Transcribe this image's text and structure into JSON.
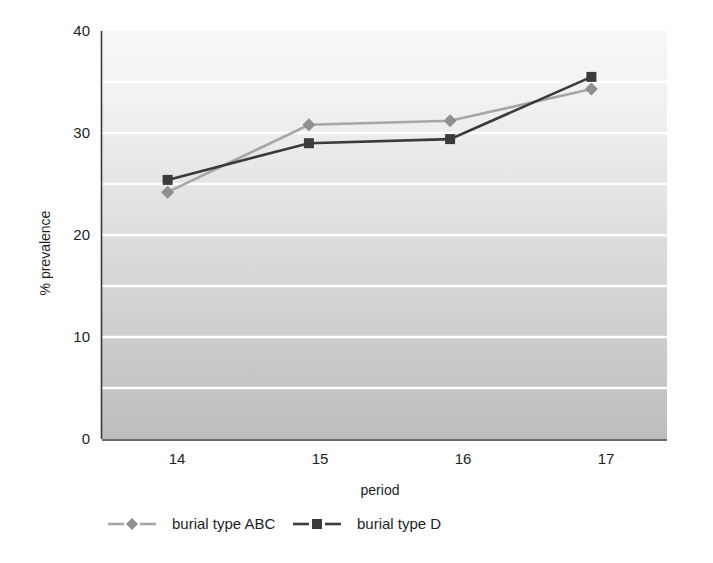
{
  "chart_data": {
    "type": "line",
    "title": "",
    "subtitle": "",
    "xlabel": "period",
    "ylabel": "% prevalence",
    "x": [
      14,
      15,
      16,
      17
    ],
    "categories": [
      "14",
      "15",
      "16",
      "17"
    ],
    "xtick_labels": [
      "14",
      "15",
      "16",
      "17"
    ],
    "ytick_labels": [
      "0",
      "10",
      "20",
      "30",
      "40"
    ],
    "ytick_values": [
      0,
      10,
      20,
      30,
      40
    ],
    "ylim": [
      0,
      40
    ],
    "gridlines_at": [
      5,
      10,
      15,
      20,
      25,
      30,
      35
    ],
    "grid": "horizontal-only",
    "grid_color": "#ffffff",
    "legend_position": "bottom-left",
    "plot_background": "vertical gradient light-gray to mid-gray",
    "plot_bg_top_color": "#f7f7f7",
    "plot_bg_bottom_color": "#bcbcbc",
    "series": [
      {
        "name": "burial type ABC",
        "marker": "diamond",
        "color": "#a6a6a6",
        "values": [
          24.2,
          30.8,
          31.2,
          34.3
        ]
      },
      {
        "name": "burial type D",
        "marker": "square",
        "color": "#3b3b3b",
        "values": [
          25.4,
          29.0,
          29.4,
          35.5
        ]
      }
    ]
  },
  "legend": {
    "items": [
      {
        "label": "burial type ABC",
        "color": "#a6a6a6",
        "marker": "diamond"
      },
      {
        "label": "burial type D",
        "color": "#3b3b3b",
        "marker": "square"
      }
    ]
  },
  "axes": {
    "x_title": "period",
    "y_title": "% prevalence"
  }
}
